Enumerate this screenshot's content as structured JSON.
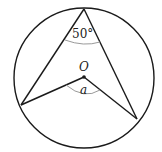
{
  "diagram": {
    "center_label": "O",
    "inscribed_angle_label": "50°",
    "central_angle_label": "a",
    "colors": {
      "stroke": "#1a1a1a",
      "arc": "#9a9a9a"
    }
  }
}
